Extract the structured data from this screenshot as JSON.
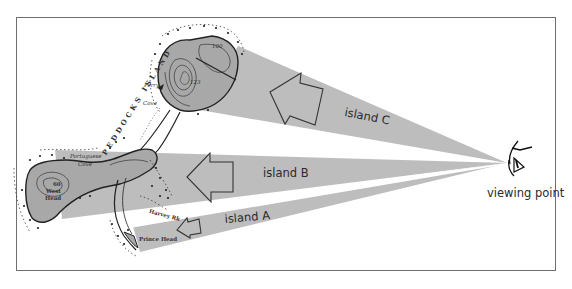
{
  "figure": {
    "labels": {
      "island_c": "island C",
      "island_b": "island B",
      "island_a": "island A",
      "viewing_point": "viewing point"
    },
    "map_labels": {
      "perry_cove_1": "Perry",
      "perry_cove_2": "Cove",
      "portuguese_cove_1": "Portuguese",
      "portuguese_cove_2": "Cove",
      "west_head_elev": "60",
      "west_head_1": "West",
      "west_head_2": "Head",
      "harvey_rk": "Harvey Rk",
      "prince_head": "Prince Head",
      "elev_100": "100",
      "elev_123": "123",
      "island_name": "PEDDOCKS ISLAND"
    },
    "colors": {
      "cone_fill": "#bdbdbd",
      "island_fill": "#a8a8a8",
      "frame": "#6e6e6e",
      "ink": "#2a2a2a"
    },
    "icons": {
      "viewing_point": "eye-icon",
      "arrows": "left-arrow-outline"
    }
  }
}
